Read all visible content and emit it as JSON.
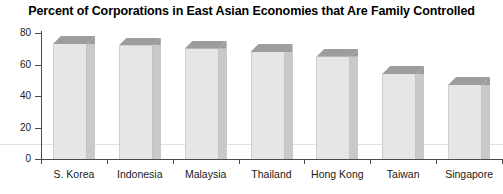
{
  "chart_data": {
    "type": "bar",
    "title": "Percent of Corporations in East Asian Economies that Are Family Controlled",
    "xlabel": "",
    "ylabel": "",
    "categories": [
      "S. Korea",
      "Indonesia",
      "Malaysia",
      "Thailand",
      "Hong Kong",
      "Taiwan",
      "Singapore"
    ],
    "values": [
      73,
      72,
      70,
      68,
      65,
      54,
      47
    ],
    "ylim": [
      0,
      80
    ],
    "yticks": [
      0,
      20,
      40,
      60,
      80
    ],
    "ytick_labels": [
      "0",
      "20",
      "40",
      "60",
      "80"
    ],
    "grid": false,
    "legend": null,
    "style": {
      "bar_front_color": "#e6e6e6",
      "bar_top_color": "#9d9d9d",
      "bar_side_color": "#c9c9c9",
      "axis_color": "#4a4a4a",
      "text_color": "#1a1a1a",
      "background": "#ffffff",
      "three_d": true
    }
  }
}
